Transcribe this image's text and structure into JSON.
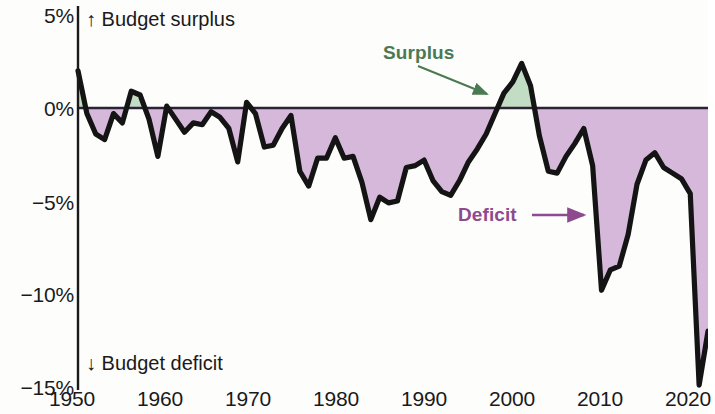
{
  "chart_data": {
    "type": "area",
    "title": "",
    "subtitle": "",
    "xlabel": "",
    "ylabel": "",
    "xlim": [
      1950,
      2021
    ],
    "ylim": [
      -15,
      5
    ],
    "grid": false,
    "legend_position": "inline-annotation",
    "zero_line": 0,
    "axis_note_top": "↑ Budget surplus",
    "axis_note_bottom": "↓ Budget deficit",
    "y_ticks": [
      "5%",
      "0%",
      "−5%",
      "−10%",
      "−15%"
    ],
    "y_tick_values": [
      5,
      0,
      -5,
      -10,
      -15
    ],
    "x_ticks": [
      "1950",
      "1960",
      "1970",
      "1980",
      "1990",
      "2000",
      "2010",
      "2020"
    ],
    "x_tick_values": [
      1950,
      1960,
      1970,
      1980,
      1990,
      2000,
      2010,
      2020
    ],
    "series": [
      {
        "name": "Federal budget surplus or deficit as percent of GDP",
        "x": [
          1950,
          1951,
          1952,
          1953,
          1954,
          1955,
          1956,
          1957,
          1958,
          1959,
          1960,
          1961,
          1962,
          1963,
          1964,
          1965,
          1966,
          1967,
          1968,
          1969,
          1970,
          1971,
          1972,
          1973,
          1974,
          1975,
          1976,
          1977,
          1978,
          1979,
          1980,
          1981,
          1982,
          1983,
          1984,
          1985,
          1986,
          1987,
          1988,
          1989,
          1990,
          1991,
          1992,
          1993,
          1994,
          1995,
          1996,
          1997,
          1998,
          1999,
          2000,
          2001,
          2002,
          2003,
          2004,
          2005,
          2006,
          2007,
          2008,
          2009,
          2010,
          2011,
          2012,
          2013,
          2014,
          2015,
          2016,
          2017,
          2018,
          2019,
          2020,
          2021
        ],
        "values": [
          2.0,
          -0.3,
          -1.4,
          -1.7,
          -0.3,
          -0.8,
          0.9,
          0.7,
          -0.6,
          -2.6,
          0.1,
          -0.6,
          -1.3,
          -0.8,
          -0.9,
          -0.2,
          -0.5,
          -1.1,
          -2.9,
          0.3,
          -0.3,
          -2.1,
          -2.0,
          -1.1,
          -0.4,
          -3.4,
          -4.2,
          -2.7,
          -2.7,
          -1.6,
          -2.7,
          -2.6,
          -4.0,
          -6.0,
          -4.8,
          -5.1,
          -5.0,
          -3.2,
          -3.1,
          -2.8,
          -3.9,
          -4.5,
          -4.7,
          -3.9,
          -2.9,
          -2.2,
          -1.4,
          -0.3,
          0.8,
          1.4,
          2.4,
          1.2,
          -1.5,
          -3.4,
          -3.5,
          -2.6,
          -1.9,
          -1.1,
          -3.1,
          -9.8,
          -8.7,
          -8.5,
          -6.8,
          -4.1,
          -2.8,
          -2.4,
          -3.2,
          -3.5,
          -3.8,
          -4.6,
          -14.9,
          -12.0
        ],
        "color_line": "#141414",
        "color_fill_positive": "#c3ddc4",
        "color_fill_negative": "#d6b9da"
      }
    ],
    "annotations": [
      {
        "name": "surplus",
        "text": "Surplus",
        "color": "#4a7a52",
        "text_x": 383,
        "text_y": 42,
        "arrow_from_x": 418,
        "arrow_from_y": 66,
        "arrow_to_x": 487,
        "arrow_to_y": 94
      },
      {
        "name": "deficit",
        "text": "Deficit",
        "color": "#8e4a8e",
        "text_x": 458,
        "text_y": 204,
        "arrow_from_x": 532,
        "arrow_from_y": 215,
        "arrow_to_x": 584,
        "arrow_to_y": 215
      }
    ]
  }
}
